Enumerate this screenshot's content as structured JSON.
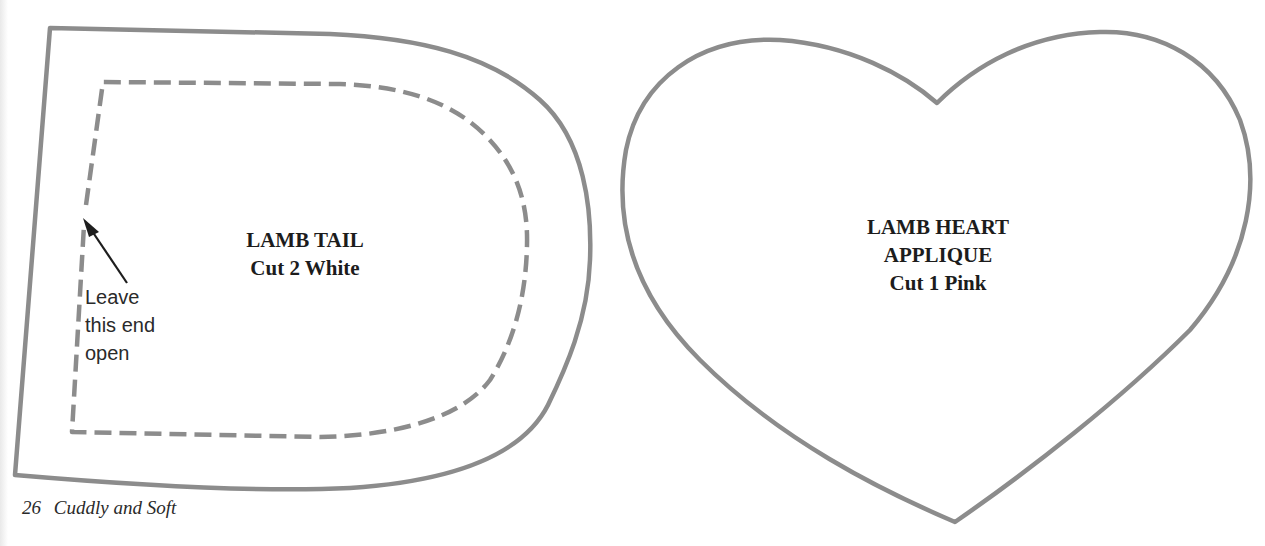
{
  "colors": {
    "outline": "#8c8c8c",
    "text": "#1c1c1c",
    "background": "#ffffff"
  },
  "tail_pattern": {
    "title": "LAMB TAIL",
    "instruction": "Cut 2 White",
    "note_lines": [
      "Leave",
      "this end",
      "open"
    ],
    "note_icon": "arrow-icon"
  },
  "heart_pattern": {
    "title_line1": "LAMB HEART",
    "title_line2": "APPLIQUE",
    "instruction": "Cut 1 Pink"
  },
  "footer": {
    "page_number": "26",
    "book_title": "Cuddly and Soft"
  }
}
